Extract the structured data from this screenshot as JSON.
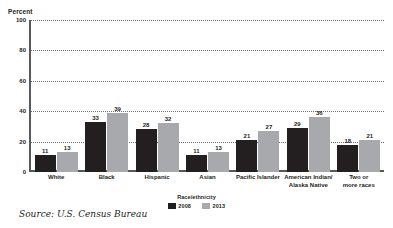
{
  "chart_data": {
    "type": "bar",
    "title": "",
    "xlabel": "Race/ethnicity",
    "ylabel": "Percent",
    "ylim": [
      0,
      100
    ],
    "yticks": [
      0,
      20,
      40,
      60,
      80,
      100
    ],
    "grid": true,
    "legend_position": "bottom",
    "categories": [
      "White",
      "Black",
      "Hispanic",
      "Asian",
      "Pacific Islander",
      "American Indian/\nAlaska Native",
      "Two or\nmore races"
    ],
    "series": [
      {
        "name": "2008",
        "color": "#231f20",
        "values": [
          11,
          33,
          28,
          11,
          21,
          29,
          18
        ]
      },
      {
        "name": "2013",
        "color": "#a7a9ac",
        "values": [
          13,
          39,
          32,
          13,
          27,
          36,
          21
        ]
      }
    ],
    "source": "Source: U.S. Census Bureau"
  },
  "axis": {
    "y_label": "Percent",
    "y_ticks": [
      "100",
      "80",
      "60",
      "40",
      "20",
      "0"
    ],
    "x_label": "Race/ethnicity"
  },
  "legend": {
    "items": [
      {
        "label": "2008"
      },
      {
        "label": "2013"
      }
    ]
  },
  "footer": {
    "source": "Source: U.S. Census Bureau"
  },
  "colors": {
    "series_2008": "#231f20",
    "series_2013": "#a7a9ac",
    "axis": "#58595b",
    "grid": "#6d6e71",
    "text": "#231f20",
    "background": "#ffffff"
  }
}
